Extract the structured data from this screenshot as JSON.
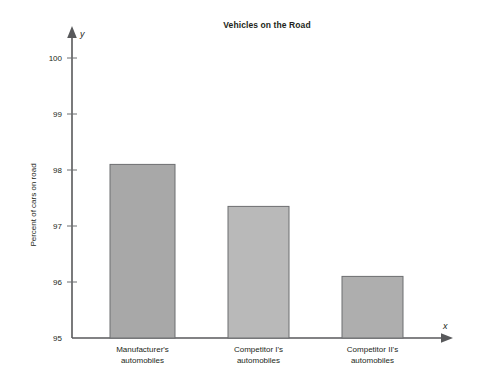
{
  "chart_data": {
    "type": "bar",
    "title": "Vehicles on the Road",
    "xlabel": "",
    "ylabel": "Percent of cars on road",
    "x_axis_symbol": "x",
    "y_axis_symbol": "y",
    "categories": [
      "Manufacturer's\nautomobiles",
      "Competitor I's\nautomobiles",
      "Competitor II's\nautomobiles"
    ],
    "category_lines": [
      [
        "Manufacturer's",
        "automobiles"
      ],
      [
        "Competitor I's",
        "automobiles"
      ],
      [
        "Competitor II's",
        "automobiles"
      ]
    ],
    "values": [
      98.1,
      97.35,
      96.1
    ],
    "ylim": [
      95,
      100.4
    ],
    "yticks": [
      95,
      96,
      97,
      98,
      99,
      100
    ],
    "ytick_labels": [
      "95",
      "96",
      "97",
      "98",
      "99",
      "100"
    ],
    "grid": false,
    "legend": false,
    "bar_colors": [
      "#a8a8a8",
      "#b9b9b9",
      "#aeaeae"
    ],
    "bar_edge_color": "#6d6e71",
    "axis_color": "#58595b",
    "text_color": "#231f20",
    "background": "#ffffff"
  },
  "geometry": {
    "axis_x": 72,
    "baseline_y": 338,
    "x_axis_end": 450,
    "y_axis_top": 30,
    "px_per_unit": 56.0,
    "bars": [
      {
        "x": 110,
        "width": 65
      },
      {
        "x": 228,
        "width": 61
      },
      {
        "x": 342,
        "width": 61
      }
    ]
  }
}
